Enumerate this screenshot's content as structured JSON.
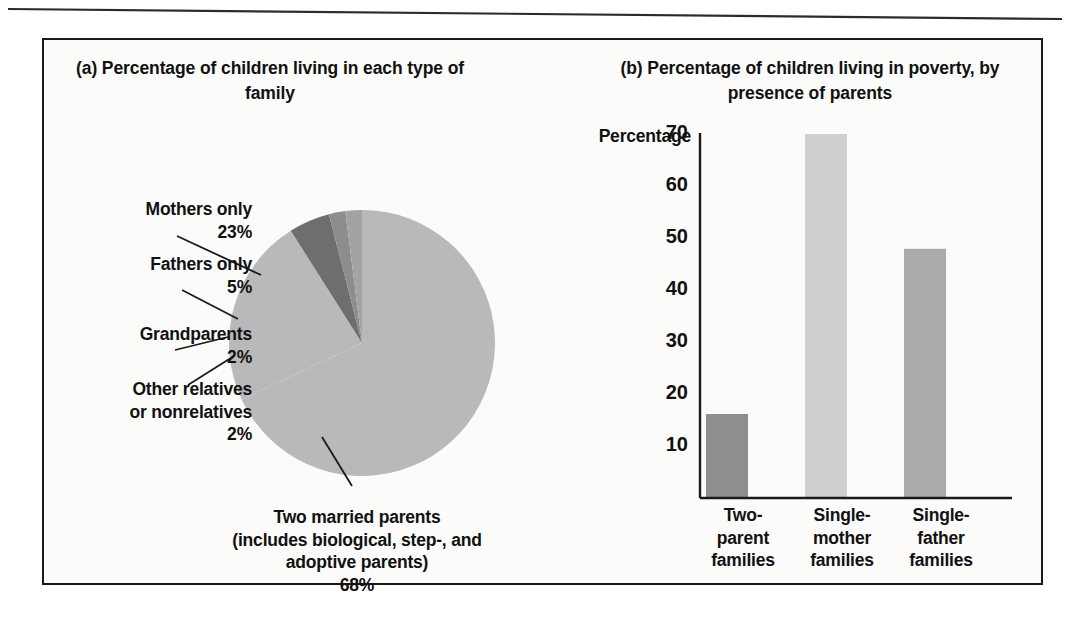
{
  "figure": {
    "background_color": "#fbfbfa",
    "frame_color": "#1a1a1a"
  },
  "panel_a": {
    "title": "(a) Percentage of children living\nin each type of family",
    "labels": {
      "mothers": "Mothers only\n23%",
      "fathers": "Fathers only\n5%",
      "grandparents": "Grandparents\n2%",
      "other": "Other relatives\nor nonrelatives\n2%",
      "married": "Two married parents\n(includes biological, step-, and\nadoptive parents)\n68%"
    }
  },
  "panel_b": {
    "title": "(b) Percentage of children living\nin poverty, by presence of parents",
    "y_axis_title": "Percentage",
    "ticks": [
      "70",
      "60",
      "50",
      "40",
      "30",
      "20",
      "10"
    ],
    "categories": [
      "Two-\nparent\nfamilies",
      "Single-\nmother\nfamilies",
      "Single-\nfather\nfamilies"
    ]
  },
  "chart_data": [
    {
      "type": "pie",
      "title": "(a) Percentage of children living in each type of family",
      "labels": [
        "Two married parents (includes biological, step-, and adoptive parents)",
        "Mothers only",
        "Fathers only",
        "Grandparents",
        "Other relatives or nonrelatives"
      ],
      "values": [
        68,
        23,
        5,
        2,
        2
      ],
      "unit": "percent",
      "colors": [
        "#b9b9b9",
        "#b9b9b9",
        "#6e6e6e",
        "#8d8d8d",
        "#a3a3a3"
      ],
      "start_angle_deg": 90,
      "direction": "counterclockwise",
      "legend": "none"
    },
    {
      "type": "bar",
      "title": "(b) Percentage of children living in poverty, by presence of parents",
      "categories": [
        "Two-parent families",
        "Single-mother families",
        "Single-father families"
      ],
      "values": [
        15,
        65,
        44.5
      ],
      "xlabel": "",
      "ylabel": "Percentage",
      "ylim": [
        0,
        70
      ],
      "yticks": [
        10,
        20,
        30,
        40,
        50,
        60,
        70
      ],
      "grid": false,
      "legend": "none",
      "bar_colors": [
        "#8e8e8e",
        "#cfcfcf",
        "#ababab"
      ]
    }
  ]
}
